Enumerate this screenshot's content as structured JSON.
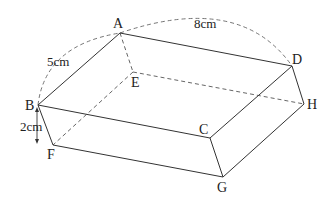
{
  "figure": {
    "type": "cuboid-diagram",
    "vertices": {
      "A": {
        "label": "A",
        "x": 120,
        "y": 33
      },
      "B": {
        "label": "B",
        "x": 38,
        "y": 105
      },
      "C": {
        "label": "C",
        "x": 210,
        "y": 138
      },
      "D": {
        "label": "D",
        "x": 292,
        "y": 66
      },
      "E": {
        "label": "E",
        "x": 133,
        "y": 72
      },
      "F": {
        "label": "F",
        "x": 53,
        "y": 145
      },
      "G": {
        "label": "G",
        "x": 223,
        "y": 177
      },
      "H": {
        "label": "H",
        "x": 304,
        "y": 104
      }
    },
    "dimensions": {
      "AB": "5cm",
      "AD": "8cm",
      "BF": "2cm"
    },
    "edges_solid": [
      "AB",
      "AD",
      "BC",
      "CD",
      "BF",
      "CG",
      "DH",
      "FG",
      "GH"
    ],
    "edges_hidden": [
      "AE",
      "EF",
      "EH"
    ]
  }
}
